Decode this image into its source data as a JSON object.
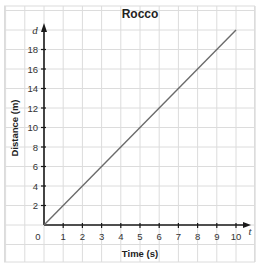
{
  "chart_data": {
    "type": "line",
    "title": "Rocco",
    "xlabel": "Time (s)",
    "ylabel": "Distance (m)",
    "x_var": "t",
    "y_var": "d",
    "xlim": [
      0,
      10
    ],
    "ylim": [
      0,
      20
    ],
    "x_ticks": [
      0,
      1,
      2,
      3,
      4,
      5,
      6,
      7,
      8,
      9,
      10
    ],
    "y_ticks": [
      2,
      4,
      6,
      8,
      10,
      12,
      14,
      16,
      18
    ],
    "grid": true,
    "legend": null,
    "series": [
      {
        "name": "Rocco",
        "x": [
          0,
          10
        ],
        "y": [
          0,
          20
        ],
        "color": "#6b6b6b"
      }
    ]
  },
  "colors": {
    "grid": "#dcdcdc",
    "axis": "#1a1a1a",
    "line": "#6b6b6b"
  },
  "labels": {
    "origin": "0"
  }
}
